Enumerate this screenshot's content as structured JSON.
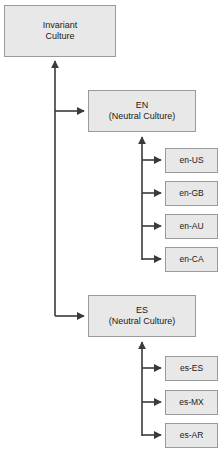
{
  "diagram": {
    "type": "tree",
    "colors": {
      "node_fill": "#e8e8e8",
      "node_border": "#9a9a9a",
      "edge": "#3a3a3a",
      "text": "#1a1a1a",
      "background": "#ffffff"
    },
    "nodes": {
      "invariant": {
        "label": "Invariant",
        "label2": "Culture"
      },
      "en": {
        "label": "EN",
        "label2": "(Neutral Culture)"
      },
      "es": {
        "label": "ES",
        "label2": "(Neutral Culture)"
      },
      "en_children": [
        {
          "label": "en-US"
        },
        {
          "label": "en-GB"
        },
        {
          "label": "en-AU"
        },
        {
          "label": "en-CA"
        }
      ],
      "es_children": [
        {
          "label": "es-ES"
        },
        {
          "label": "es-MX"
        },
        {
          "label": "es-AR"
        }
      ]
    }
  }
}
